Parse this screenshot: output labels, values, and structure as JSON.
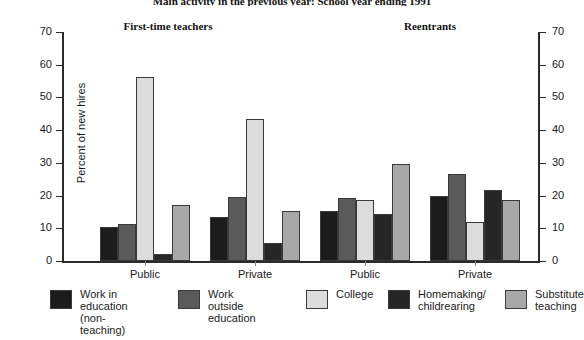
{
  "chart_data": {
    "type": "bar",
    "title": "Main activity in the previous year: School year ending 1991",
    "xlabel": "",
    "ylabel": "Percent of new hires",
    "ylim": [
      0,
      70
    ],
    "ytick_step": 10,
    "yticks": [
      0,
      10,
      20,
      30,
      40,
      50,
      60,
      70
    ],
    "grid": false,
    "legend_position": "bottom",
    "panels": [
      {
        "label": "First-time teachers"
      },
      {
        "label": "Reentrants"
      }
    ],
    "categories": [
      "Public",
      "Private",
      "Public",
      "Private"
    ],
    "series": [
      {
        "name": "Work in education (non-teaching)",
        "color": "#1c1c1c",
        "values": [
          10.3,
          13.4,
          15.4,
          20.0
        ]
      },
      {
        "name": "Work outside education",
        "color": "#5a5a5a",
        "values": [
          11.2,
          19.6,
          19.4,
          26.5
        ]
      },
      {
        "name": "College",
        "color": "#dcdcdc",
        "values": [
          56.2,
          43.4,
          18.6,
          11.9
        ]
      },
      {
        "name": "Homemaking/ childrearing",
        "color": "#262626",
        "values": [
          2.1,
          5.4,
          14.5,
          21.6
        ]
      },
      {
        "name": "Substitute teaching",
        "color": "#a8a8a8",
        "values": [
          17.2,
          15.4,
          29.6,
          18.8
        ]
      }
    ]
  },
  "legend": {
    "items": [
      {
        "label": "Work in\neducation\n(non-teaching)",
        "color": "#1c1c1c"
      },
      {
        "label": "Work outside\neducation",
        "color": "#5a5a5a"
      },
      {
        "label": "College",
        "color": "#dcdcdc"
      },
      {
        "label": "Homemaking/\nchildrearing",
        "color": "#262626"
      },
      {
        "label": "Substitute\nteaching",
        "color": "#a8a8a8"
      }
    ]
  },
  "axis": {
    "left_labels": [
      "70",
      "60",
      "50",
      "40",
      "30",
      "20",
      "10",
      "0"
    ],
    "right_labels": [
      "70",
      "60",
      "50",
      "40",
      "30",
      "20",
      "10",
      "0"
    ]
  }
}
